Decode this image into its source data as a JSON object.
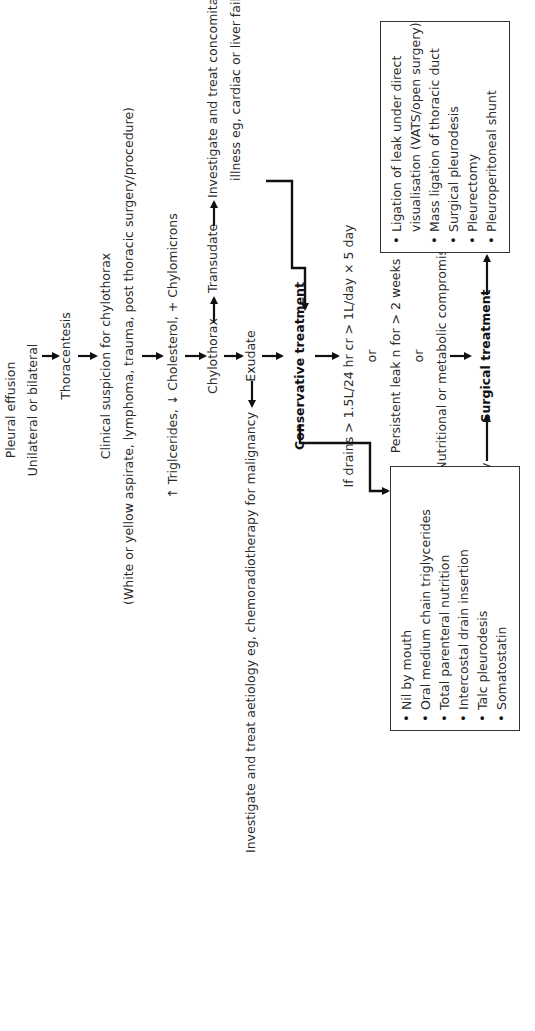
{
  "flowchart": {
    "orientation": "rotated 90 degrees counter-clockwise",
    "nodes": {
      "pleural_effusion": "Pleural effusion",
      "unilateral": "Unilateral or bilateral",
      "thoracentesis": "Thoracentesis",
      "clinical_suspicion": "Clinical suspicion for chylothorax",
      "clinical_detail": "(White or yellow aspirate, lymphoma, trauma, post thoracic surgery/procedure)",
      "lab_findings": "↑ Triglcerides, ↓ Cholesterol, + Chylomicrons",
      "chylothorax": "Chylothorax",
      "transudate": "Transudate",
      "concomitant_line1": "Investigate and treat concomitant",
      "concomitant_line2": "illness eg, cardiac or liver failure",
      "exudate": "Exudate",
      "malignancy": "Investigate and treat aetiology eg, chemoradiotherapy for malignancy",
      "conservative": "Conservative treatment",
      "criteria_1": "If drains > 1.5L/24 hr cr > 1L/day × 5 day",
      "or_1": "or",
      "criteria_2": "Persistent leak n for > 2 weeks",
      "or_2": "or",
      "criteria_3": "Nutritional or metabolic compromise",
      "surgical": "Surgical treatment",
      "post_oesophagectomy": "Chylothorax post oesophagectomy"
    },
    "conservative_box": {
      "items": [
        "Nil by mouth",
        "Oral medium chain triglycerides",
        "Total parenteral nutrition",
        "Intercostal drain insertion",
        "Talc pleurodesis",
        "Somatostatin"
      ]
    },
    "surgical_box": {
      "items": [
        "Ligation of leak under direct",
        "Mass ligation of thoracic duct",
        "Surgical pleurodesis",
        "Pleurectomy",
        "Pleuroperitoneal shunt"
      ],
      "item_1_continuation": "visualisation (VATS/open surgery)"
    },
    "colors": {
      "line": "#111111",
      "text": "#2a2a2a",
      "background": "#ffffff"
    }
  }
}
